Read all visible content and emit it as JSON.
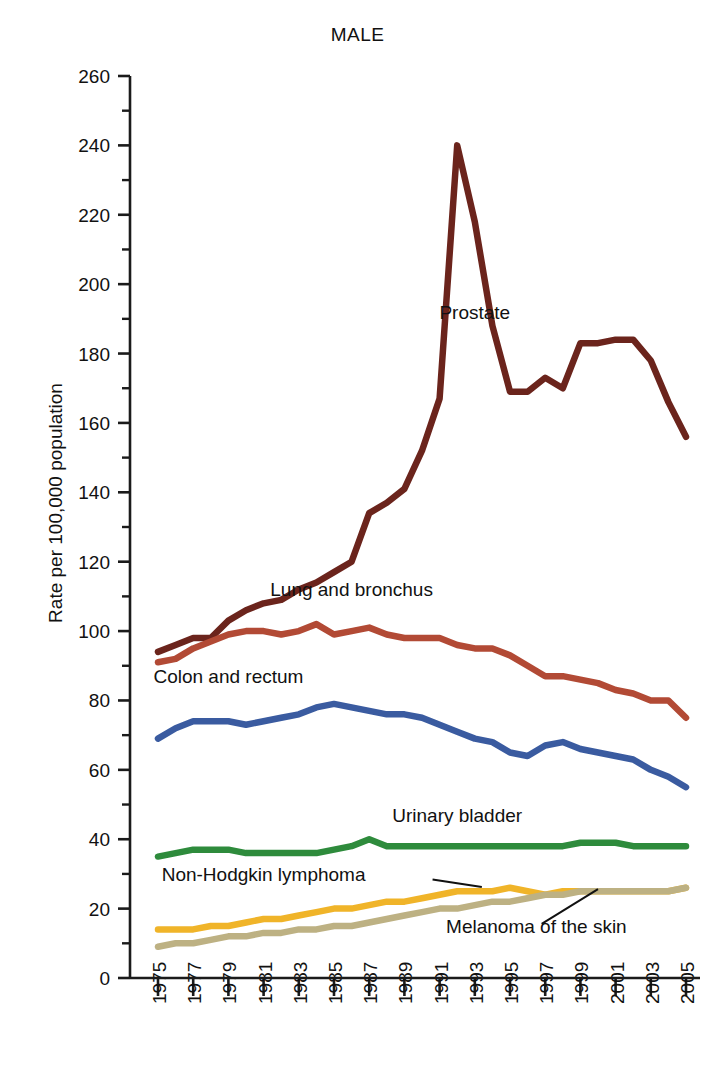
{
  "chart_data": {
    "type": "line",
    "title": "MALE",
    "xlabel": "",
    "ylabel": "Rate per 100,000 population",
    "xlim": [
      1975,
      2005
    ],
    "ylim": [
      0,
      260
    ],
    "y_ticks": [
      0,
      20,
      40,
      60,
      80,
      100,
      120,
      140,
      160,
      180,
      200,
      220,
      240,
      260
    ],
    "y_minor_step": 10,
    "x_ticks": [
      1975,
      1977,
      1979,
      1981,
      1983,
      1985,
      1987,
      1989,
      1991,
      1993,
      1995,
      1997,
      1999,
      2001,
      2003,
      2005
    ],
    "x_tick_labels": [
      "1975",
      "1977",
      "1979",
      "1981",
      "1983",
      "1985",
      "1987",
      "1989",
      "1991",
      "1993",
      "1995",
      "1997",
      "1999",
      "2001",
      "2003",
      "2005"
    ],
    "grid": false,
    "legend": "inline-annotations",
    "x": [
      1975,
      1976,
      1977,
      1978,
      1979,
      1980,
      1981,
      1982,
      1983,
      1984,
      1985,
      1986,
      1987,
      1988,
      1989,
      1990,
      1991,
      1992,
      1993,
      1994,
      1995,
      1996,
      1997,
      1998,
      1999,
      2000,
      2001,
      2002,
      2003,
      2004,
      2005
    ],
    "series": [
      {
        "name": "Prostate",
        "color": "#6b241c",
        "label_x": 1993.0,
        "label_y": 190.0,
        "values": [
          94,
          96,
          98,
          98,
          103,
          106,
          108,
          109,
          112,
          114,
          117,
          120,
          134,
          137,
          141,
          152,
          167,
          240,
          218,
          188,
          169,
          169,
          173,
          170,
          183,
          183,
          184,
          184,
          178,
          166,
          156
        ]
      },
      {
        "name": "Lung and bronchus",
        "color": "#b24a35",
        "label_x": 1986.0,
        "label_y": 110.0,
        "values": [
          91,
          92,
          95,
          97,
          99,
          100,
          100,
          99,
          100,
          102,
          99,
          100,
          101,
          99,
          98,
          98,
          98,
          96,
          95,
          95,
          93,
          90,
          87,
          87,
          86,
          85,
          83,
          82,
          80,
          80,
          75
        ]
      },
      {
        "name": "Colon and rectum",
        "color": "#3a5ba0",
        "label_x": 1979.0,
        "label_y": 85.0,
        "values": [
          69,
          72,
          74,
          74,
          74,
          73,
          74,
          75,
          76,
          78,
          79,
          78,
          77,
          76,
          76,
          75,
          73,
          71,
          69,
          68,
          65,
          64,
          67,
          68,
          66,
          65,
          64,
          63,
          60,
          58,
          55
        ]
      },
      {
        "name": "Urinary bladder",
        "color": "#2e8b3c",
        "label_x": 1992.0,
        "label_y": 45.0,
        "values": [
          35,
          36,
          37,
          37,
          37,
          36,
          36,
          36,
          36,
          36,
          37,
          38,
          40,
          38,
          38,
          38,
          38,
          38,
          38,
          38,
          38,
          38,
          38,
          38,
          39,
          39,
          39,
          38,
          38,
          38,
          38
        ]
      },
      {
        "name": "Non-Hodgkin lymphoma",
        "color": "#f0b429",
        "label_x": 1981.0,
        "label_y": 28.0,
        "values": [
          14,
          14,
          14,
          15,
          15,
          16,
          17,
          17,
          18,
          19,
          20,
          20,
          21,
          22,
          22,
          23,
          24,
          25,
          25,
          25,
          26,
          25,
          24,
          25,
          25,
          25,
          25,
          25,
          25,
          25,
          26
        ]
      },
      {
        "name": "Melanoma of the skin",
        "color": "#bdb183",
        "label_x": 1996.5,
        "label_y": 13.0,
        "values": [
          9,
          10,
          10,
          11,
          12,
          12,
          13,
          13,
          14,
          14,
          15,
          15,
          16,
          17,
          18,
          19,
          20,
          20,
          21,
          22,
          22,
          23,
          24,
          24,
          25,
          25,
          25,
          25,
          25,
          25,
          26
        ]
      }
    ],
    "annotations": [
      {
        "text": "Non-Hodgkin lymphoma",
        "leader": true
      },
      {
        "text": "Melanoma of the skin",
        "leader": true
      }
    ]
  }
}
